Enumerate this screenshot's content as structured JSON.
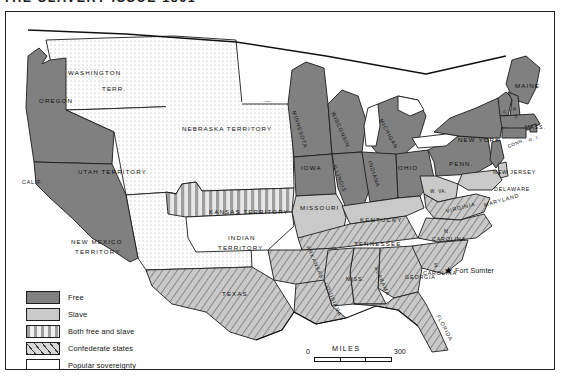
{
  "title": "THE SLAVERY ISSUE 1861",
  "legend": {
    "items": [
      {
        "label": "Free",
        "pattern": "solid-dark",
        "color": "#808080"
      },
      {
        "label": "Slave",
        "pattern": "solid-light",
        "color": "#c9c9c9"
      },
      {
        "label": "Both free and slave",
        "pattern": "vertical-stripes",
        "color": "#c9c9c9"
      },
      {
        "label": "Confederate states",
        "pattern": "diagonal-hatch",
        "color": "#c9c9c9"
      },
      {
        "label": "Popular sovereignty",
        "pattern": "dotted",
        "color": "#ffffff"
      }
    ]
  },
  "scale": {
    "zero": "0",
    "word": "MILES",
    "max": "300"
  },
  "marker": {
    "name": "Fort Sumter",
    "glyph": "★"
  },
  "places": [
    {
      "id": "washington",
      "text": "WASHINGTON",
      "x": 62,
      "y": 57,
      "cls": "lab",
      "rot": 0
    },
    {
      "id": "terr",
      "text": "TERR.",
      "x": 96,
      "y": 73,
      "cls": "lab",
      "rot": 0
    },
    {
      "id": "oregon",
      "text": "OREGON",
      "x": 33,
      "y": 85,
      "cls": "lab",
      "rot": 0
    },
    {
      "id": "calif",
      "text": "CALIF.",
      "x": 16,
      "y": 167,
      "cls": "lab sm",
      "rot": 0
    },
    {
      "id": "utah",
      "text": "UTAH TERRITORY",
      "x": 72,
      "y": 156,
      "cls": "lab",
      "rot": 0
    },
    {
      "id": "newmexico",
      "text": "NEW MEXICO",
      "x": 65,
      "y": 226,
      "cls": "lab",
      "rot": 0
    },
    {
      "id": "newmexico2",
      "text": "TERRITORY",
      "x": 69,
      "y": 236,
      "cls": "lab",
      "rot": 0
    },
    {
      "id": "nebraska",
      "text": "NEBRASKA TERRITORY",
      "x": 176,
      "y": 113,
      "cls": "lab",
      "rot": 0
    },
    {
      "id": "kansas",
      "text": "KANSAS TERRITORY",
      "x": 203,
      "y": 196,
      "cls": "lab",
      "rot": 0
    },
    {
      "id": "indian",
      "text": "INDIAN",
      "x": 222,
      "y": 222,
      "cls": "lab",
      "rot": 0
    },
    {
      "id": "indian2",
      "text": "TERRITORY",
      "x": 212,
      "y": 232,
      "cls": "lab",
      "rot": 0
    },
    {
      "id": "texas",
      "text": "TEXAS",
      "x": 216,
      "y": 278,
      "cls": "lab",
      "rot": 0
    },
    {
      "id": "minnesota",
      "text": "MINNESOTA",
      "x": 288,
      "y": 96,
      "cls": "lab sm",
      "rot": 72
    },
    {
      "id": "iowa",
      "text": "IOWA",
      "x": 295,
      "y": 152,
      "cls": "lab",
      "rot": 0
    },
    {
      "id": "wisconsin",
      "text": "WISCONSIN",
      "x": 327,
      "y": 97,
      "cls": "lab sm",
      "rot": 66
    },
    {
      "id": "michigan",
      "text": "MICHIGAN",
      "x": 375,
      "y": 104,
      "cls": "lab sm",
      "rot": 62
    },
    {
      "id": "illinois",
      "text": "ILLINOIS",
      "x": 329,
      "y": 150,
      "cls": "lab sm",
      "rot": 70
    },
    {
      "id": "indiana",
      "text": "INDIANA",
      "x": 364,
      "y": 146,
      "cls": "lab sm",
      "rot": 72
    },
    {
      "id": "ohio",
      "text": "OHIO",
      "x": 392,
      "y": 152,
      "cls": "lab",
      "rot": 0
    },
    {
      "id": "missouri",
      "text": "MISSOURI",
      "x": 294,
      "y": 192,
      "cls": "lab",
      "rot": 0
    },
    {
      "id": "kentucky",
      "text": "KENTUCKY",
      "x": 354,
      "y": 204,
      "cls": "lab",
      "rot": 0
    },
    {
      "id": "tennessee",
      "text": "TENNESSEE",
      "x": 348,
      "y": 228,
      "cls": "lab",
      "rot": 0
    },
    {
      "id": "arkansas",
      "text": "ARKANSAS",
      "x": 302,
      "y": 231,
      "cls": "lab sm",
      "rot": 66
    },
    {
      "id": "louisiana",
      "text": "LOUISIANA",
      "x": 320,
      "y": 268,
      "cls": "lab sm",
      "rot": 66
    },
    {
      "id": "miss",
      "text": "MISS.",
      "x": 340,
      "y": 264,
      "cls": "lab sm",
      "rot": 0
    },
    {
      "id": "alabama",
      "text": "ALABAMA",
      "x": 370,
      "y": 252,
      "cls": "lab sm",
      "rot": 66
    },
    {
      "id": "georgia",
      "text": "GEORGIA",
      "x": 399,
      "y": 262,
      "cls": "lab sm",
      "rot": 0
    },
    {
      "id": "florida",
      "text": "FLORIDA",
      "x": 432,
      "y": 300,
      "cls": "lab sm",
      "rot": 62
    },
    {
      "id": "scarolina",
      "text": "S.",
      "x": 428,
      "y": 250,
      "cls": "lab sm",
      "rot": 0
    },
    {
      "id": "scarolina2",
      "text": "CAROLINA",
      "x": 417,
      "y": 258,
      "cls": "lab sm",
      "rot": 0
    },
    {
      "id": "ncarolina",
      "text": "N.",
      "x": 438,
      "y": 216,
      "cls": "lab sm",
      "rot": 0
    },
    {
      "id": "ncarolina2",
      "text": "CAROLINA",
      "x": 426,
      "y": 224,
      "cls": "lab sm",
      "rot": 0
    },
    {
      "id": "virginia",
      "text": "VIRGINIA",
      "x": 440,
      "y": 196,
      "cls": "lab sm",
      "rot": -14
    },
    {
      "id": "wva",
      "text": "W. VA.",
      "x": 424,
      "y": 177,
      "cls": "lab xs",
      "rot": 0
    },
    {
      "id": "penn",
      "text": "PENN.",
      "x": 443,
      "y": 148,
      "cls": "lab",
      "rot": 0
    },
    {
      "id": "newyork",
      "text": "NEW YORK",
      "x": 452,
      "y": 124,
      "cls": "lab",
      "rot": 0
    },
    {
      "id": "maine",
      "text": "MAINE",
      "x": 509,
      "y": 70,
      "cls": "lab",
      "rot": 0
    },
    {
      "id": "nh",
      "text": "N. H.",
      "x": 508,
      "y": 93,
      "cls": "lab xs",
      "rot": 78
    },
    {
      "id": "vt",
      "text": "VT.",
      "x": 498,
      "y": 96,
      "cls": "lab xs",
      "rot": 78
    },
    {
      "id": "mass",
      "text": "MASS.",
      "x": 519,
      "y": 112,
      "cls": "lab sm",
      "rot": 0
    },
    {
      "id": "ri",
      "text": "R. I.",
      "x": 523,
      "y": 126,
      "cls": "lab xs",
      "rot": -22
    },
    {
      "id": "conn",
      "text": "CONN.",
      "x": 502,
      "y": 132,
      "cls": "lab xs",
      "rot": -22
    },
    {
      "id": "newjersey",
      "text": "NEW JERSEY",
      "x": 487,
      "y": 157,
      "cls": "lab sm",
      "rot": 0
    },
    {
      "id": "delaware",
      "text": "DELAWARE",
      "x": 488,
      "y": 174,
      "cls": "lab sm",
      "rot": 0
    },
    {
      "id": "maryland",
      "text": "MARYLAND",
      "x": 478,
      "y": 190,
      "cls": "lab sm",
      "rot": -16
    }
  ]
}
